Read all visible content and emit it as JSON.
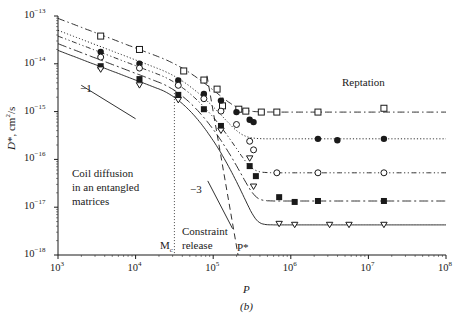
{
  "chart_data": {
    "type": "scatter",
    "title": "",
    "caption": "(b)",
    "xlabel": "P",
    "ylabel": "D*, cm²/s",
    "xscale": "log",
    "yscale": "log",
    "xlim": [
      1000,
      100000000
    ],
    "ylim": [
      1e-18,
      1e-13
    ],
    "x_ticks": [
      "10^3",
      "10^4",
      "10^5",
      "10^6",
      "10^7",
      "10^8"
    ],
    "y_ticks": [
      "10^-13",
      "10^-14",
      "10^-15",
      "10^-16",
      "10^-17",
      "10^-18"
    ],
    "grid": false,
    "legend": null,
    "annotations": [
      {
        "text": "Reptation",
        "x_log10": 6.6,
        "y_log10": -14.6
      },
      {
        "text": "Coil diffusion in an entangled matrices",
        "x_log10": 3.45,
        "y_log10": -16.2
      },
      {
        "text": "Constraint release",
        "x_log10": 4.6,
        "y_log10": -17.3
      },
      {
        "text": "M_c",
        "x_log10": 4.5,
        "y_log10": -17.8,
        "note": "vertical dotted line at P ≈ 3.2×10^4"
      },
      {
        "text": "P*",
        "x_log10": 5.25,
        "y_log10": -17.8,
        "note": "steep dashed line"
      },
      {
        "text": "-1",
        "slope_marker": true,
        "x_log10": 3.62,
        "y_log10": -14.9
      },
      {
        "text": "-3",
        "slope_marker": true,
        "x_log10": 4.73,
        "y_log10": -16.75
      }
    ],
    "series": [
      {
        "name": "open squares",
        "marker": "open-square",
        "line": "dash-dot",
        "plateau_log10_D": -15.01,
        "points_log10": [
          [
            3.55,
            -13.42
          ],
          [
            4.05,
            -13.7
          ],
          [
            4.62,
            -14.15
          ],
          [
            4.88,
            -14.34
          ],
          [
            5.05,
            -14.53
          ],
          [
            5.12,
            -14.88
          ],
          [
            5.33,
            -14.95
          ],
          [
            5.42,
            -14.99
          ],
          [
            5.62,
            -15.01
          ],
          [
            5.82,
            -15.01
          ],
          [
            6.35,
            -15.01
          ],
          [
            7.2,
            -14.93
          ]
        ]
      },
      {
        "name": "filled circles",
        "marker": "filled-circle",
        "line": "dotted",
        "plateau_log10_D": -15.57,
        "points_log10": [
          [
            3.55,
            -13.75
          ],
          [
            4.05,
            -14.0
          ],
          [
            4.55,
            -14.35
          ],
          [
            4.88,
            -14.63
          ],
          [
            5.1,
            -14.77
          ],
          [
            5.3,
            -15.01
          ],
          [
            5.47,
            -15.17
          ],
          [
            5.52,
            -15.22
          ],
          [
            6.35,
            -15.57
          ],
          [
            6.6,
            -15.6
          ],
          [
            7.2,
            -15.57
          ]
        ]
      },
      {
        "name": "open circles",
        "marker": "open-circle",
        "line": "dash-dot-dot",
        "plateau_log10_D": -16.28,
        "points_log10": [
          [
            3.55,
            -13.86
          ],
          [
            4.05,
            -14.09
          ],
          [
            4.55,
            -14.45
          ],
          [
            4.88,
            -14.73
          ],
          [
            5.1,
            -14.99
          ],
          [
            5.3,
            -15.27
          ],
          [
            5.47,
            -15.62
          ],
          [
            5.52,
            -15.8
          ],
          [
            5.82,
            -16.28
          ],
          [
            6.35,
            -16.28
          ],
          [
            7.2,
            -16.28
          ]
        ]
      },
      {
        "name": "filled squares",
        "marker": "filled-square",
        "line": "long-dash-dot",
        "plateau_log10_D": -16.87,
        "points_log10": [
          [
            3.55,
            -14.05
          ],
          [
            4.05,
            -14.32
          ],
          [
            4.55,
            -14.65
          ],
          [
            4.88,
            -14.95
          ],
          [
            5.1,
            -15.3
          ],
          [
            5.47,
            -16.14
          ],
          [
            5.55,
            -16.35
          ],
          [
            5.85,
            -16.79
          ],
          [
            6.05,
            -16.89
          ],
          [
            6.35,
            -16.87
          ],
          [
            7.2,
            -16.87
          ]
        ]
      },
      {
        "name": "open triangles",
        "marker": "open-triangle-down",
        "line": "solid",
        "plateau_log10_D": -17.37,
        "points_log10": [
          [
            3.55,
            -14.12
          ],
          [
            4.05,
            -14.45
          ],
          [
            4.55,
            -14.76
          ],
          [
            5.1,
            -15.4
          ],
          [
            5.47,
            -15.98
          ],
          [
            5.52,
            -16.57
          ],
          [
            5.85,
            -17.35
          ],
          [
            6.05,
            -17.37
          ],
          [
            6.5,
            -17.37
          ],
          [
            6.75,
            -17.37
          ],
          [
            7.2,
            -17.37
          ]
        ]
      }
    ]
  },
  "axes": {
    "x": {
      "label": "P",
      "ticks": [
        "10",
        "10",
        "10",
        "10",
        "10",
        "10"
      ],
      "exps": [
        "3",
        "4",
        "5",
        "6",
        "7",
        "8"
      ]
    },
    "y": {
      "label": "D*, cm²/s",
      "ticks": [
        "10",
        "10",
        "10",
        "10",
        "10",
        "10"
      ],
      "exps": [
        "−13",
        "−14",
        "−15",
        "−16",
        "−17",
        "−18"
      ]
    }
  },
  "labels": {
    "reptation": "Reptation",
    "coil_line1": "Coil diffusion",
    "coil_line2": "in an entangled",
    "coil_line3": "matrices",
    "constraint_line1": "Constraint",
    "constraint_line2": "release",
    "mc": "M",
    "mc_sub": "c",
    "pstar": "P*",
    "slope1": "−1",
    "slope3": "−3",
    "caption": "(b)"
  }
}
